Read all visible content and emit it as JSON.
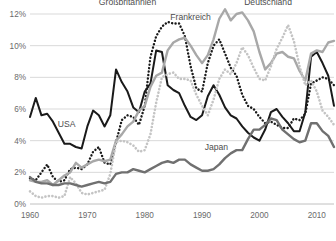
{
  "chart_data": {
    "type": "line",
    "title": "",
    "subtitle": "",
    "xlabel": "",
    "ylabel": "",
    "xlim": [
      1960,
      2013
    ],
    "ylim": [
      0,
      12
    ],
    "grid": true,
    "legend_position": "inline-annotations",
    "y_ticks": [
      "0%",
      "2%",
      "4%",
      "6%",
      "8%",
      "10%",
      "12%"
    ],
    "y_tick_values": [
      0,
      2,
      4,
      6,
      8,
      10,
      12
    ],
    "x_ticks": [
      "1960",
      "1970",
      "1980",
      "1990",
      "2000",
      "2010"
    ],
    "x_tick_values": [
      1960,
      1970,
      1980,
      1990,
      2000,
      2010
    ],
    "x": [
      1960,
      1961,
      1962,
      1963,
      1964,
      1965,
      1966,
      1967,
      1968,
      1969,
      1970,
      1971,
      1972,
      1973,
      1974,
      1975,
      1976,
      1977,
      1978,
      1979,
      1980,
      1981,
      1982,
      1983,
      1984,
      1985,
      1986,
      1987,
      1988,
      1989,
      1990,
      1991,
      1992,
      1993,
      1994,
      1995,
      1996,
      1997,
      1998,
      1999,
      2000,
      2001,
      2002,
      2003,
      2004,
      2005,
      2006,
      2007,
      2008,
      2009,
      2010,
      2011,
      2012,
      2013
    ],
    "series": [
      {
        "name": "USA",
        "color": "#1a1a1a",
        "style": "solid",
        "width": 2.0,
        "label_x": 1966.4,
        "label_y": 4.85,
        "values": [
          5.5,
          6.7,
          5.6,
          5.7,
          5.2,
          4.5,
          3.8,
          3.8,
          3.6,
          3.5,
          4.9,
          5.9,
          5.6,
          4.9,
          5.6,
          8.5,
          7.7,
          7.1,
          6.1,
          5.8,
          7.1,
          7.6,
          9.7,
          9.6,
          7.5,
          7.2,
          7.0,
          6.2,
          5.5,
          5.3,
          5.6,
          6.8,
          7.5,
          6.9,
          6.1,
          5.6,
          5.4,
          4.9,
          4.5,
          4.2,
          4.0,
          4.7,
          5.8,
          6.0,
          5.5,
          5.1,
          4.6,
          4.6,
          5.8,
          9.3,
          9.6,
          8.9,
          8.1,
          6.2
        ]
      },
      {
        "name": "Großbritannien",
        "color": "#1a1a1a",
        "style": "dotted",
        "width": 2.0,
        "label_x": 1977.0,
        "label_y": 12.6,
        "values": [
          1.6,
          1.5,
          2.0,
          2.5,
          1.7,
          1.4,
          1.5,
          2.2,
          2.3,
          2.2,
          2.5,
          3.3,
          3.6,
          2.6,
          2.5,
          3.9,
          5.3,
          5.6,
          5.5,
          5.0,
          6.2,
          9.3,
          10.6,
          11.2,
          11.5,
          11.4,
          11.4,
          10.6,
          8.7,
          7.3,
          7.1,
          8.9,
          10.0,
          10.4,
          9.5,
          8.6,
          8.1,
          6.9,
          6.2,
          6.0,
          5.5,
          5.1,
          5.2,
          5.0,
          4.8,
          4.8,
          5.4,
          5.3,
          5.7,
          7.6,
          7.8,
          8.0,
          7.9,
          7.5
        ]
      },
      {
        "name": "Frankreich",
        "color": "#a8a8a8",
        "style": "solid",
        "width": 2.4,
        "label_x": 1988.0,
        "label_y": 11.6,
        "values": [
          1.5,
          1.4,
          1.4,
          1.5,
          1.2,
          1.5,
          1.8,
          2.0,
          2.6,
          2.3,
          2.5,
          2.7,
          2.8,
          2.7,
          2.8,
          4.0,
          4.4,
          4.9,
          5.2,
          5.9,
          6.2,
          7.4,
          8.1,
          8.3,
          9.7,
          10.2,
          10.4,
          10.5,
          10.0,
          9.4,
          8.9,
          9.4,
          10.4,
          11.7,
          12.3,
          11.6,
          12.0,
          12.1,
          11.6,
          10.9,
          9.6,
          8.5,
          8.9,
          9.5,
          9.6,
          9.3,
          9.2,
          8.4,
          7.8,
          9.5,
          9.7,
          9.6,
          10.2,
          10.3
        ]
      },
      {
        "name": "Deutschland",
        "color": "#c4c4c4",
        "style": "dotted",
        "width": 2.2,
        "label_x": 2001.5,
        "label_y": 12.6,
        "values": [
          0.8,
          0.5,
          0.4,
          0.5,
          0.5,
          0.4,
          0.5,
          1.7,
          1.3,
          0.7,
          0.6,
          0.7,
          0.8,
          0.9,
          1.9,
          3.9,
          4.0,
          3.9,
          3.7,
          3.3,
          3.4,
          4.4,
          6.4,
          8.0,
          8.2,
          8.3,
          7.9,
          7.9,
          7.8,
          6.9,
          6.2,
          5.6,
          6.6,
          7.9,
          8.5,
          8.2,
          8.9,
          9.9,
          9.4,
          8.6,
          7.9,
          7.8,
          8.7,
          9.8,
          10.5,
          11.3,
          10.3,
          8.7,
          7.5,
          7.8,
          7.1,
          5.9,
          5.5,
          5.0
        ]
      },
      {
        "name": "Japan",
        "color": "#707070",
        "style": "solid",
        "width": 2.4,
        "label_x": 1992.5,
        "label_y": 3.4,
        "values": [
          1.7,
          1.4,
          1.3,
          1.3,
          1.2,
          1.2,
          1.3,
          1.3,
          1.2,
          1.1,
          1.2,
          1.3,
          1.4,
          1.3,
          1.4,
          1.9,
          2.0,
          2.0,
          2.2,
          2.1,
          2.0,
          2.2,
          2.4,
          2.6,
          2.7,
          2.6,
          2.8,
          2.8,
          2.5,
          2.3,
          2.1,
          2.1,
          2.2,
          2.5,
          2.9,
          3.2,
          3.4,
          3.4,
          4.1,
          4.7,
          4.7,
          5.0,
          5.4,
          5.3,
          4.7,
          4.4,
          4.1,
          3.9,
          4.0,
          5.1,
          5.1,
          4.6,
          4.3,
          3.6
        ]
      }
    ]
  },
  "axis": {
    "y_labels": [
      "12%",
      "10%",
      "8%",
      "6%",
      "4%",
      "2%",
      "0%"
    ],
    "x_labels": [
      "1960",
      "1970",
      "1980",
      "1990",
      "2000",
      "2010"
    ]
  }
}
